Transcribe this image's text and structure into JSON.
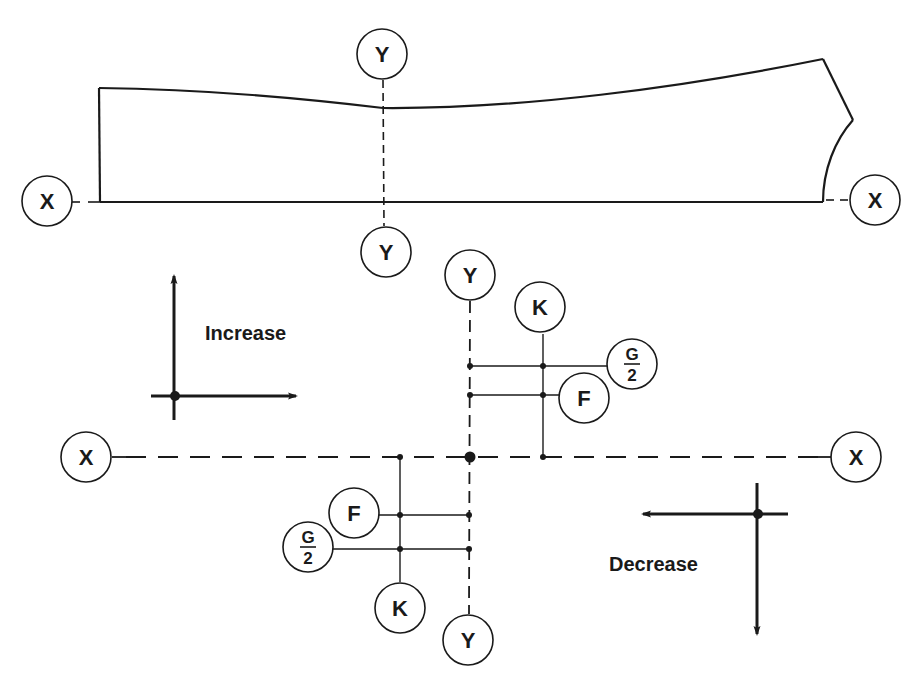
{
  "diagram": {
    "type": "engineering-datum-diagram",
    "colors": {
      "ink": "#1a1a1a",
      "background": "#ffffff"
    },
    "top_part": {
      "description": "Tapered beam profile with X-X baseline and Y-Y section line",
      "labels": {
        "x_left": "X",
        "x_right": "X",
        "y_top": "Y",
        "y_bottom": "Y"
      }
    },
    "axes_diagram": {
      "labels": {
        "x_left": "X",
        "x_right": "X",
        "y_top": "Y",
        "y_bottom": "Y",
        "k_upper": "K",
        "k_lower": "K",
        "f_upper": "F",
        "f_lower": "F",
        "g_num_upper": "G",
        "g_den_upper": "2",
        "g_num_lower": "G",
        "g_den_lower": "2"
      }
    },
    "legend": {
      "increase": "Increase",
      "decrease": "Decrease"
    }
  }
}
